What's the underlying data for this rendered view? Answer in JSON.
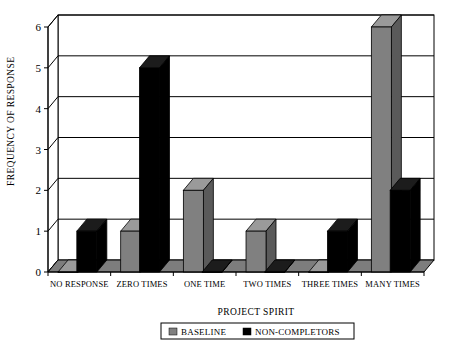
{
  "chart_data": {
    "type": "bar",
    "title": "",
    "xlabel": "PROJECT SPIRIT",
    "ylabel": "FREQUENCY OF RESPONSE",
    "categories": [
      "NO RESPONSE",
      "ZERO TIMES",
      "ONE TIME",
      "TWO TIMES",
      "THREE TIMES",
      "MANY TIMES"
    ],
    "series": [
      {
        "name": "BASELINE",
        "color": "#808080",
        "values": [
          0,
          1,
          2,
          1,
          0,
          6
        ]
      },
      {
        "name": "NON-COMPLETORS",
        "color": "#000000",
        "values": [
          1,
          5,
          0,
          0,
          1,
          2
        ]
      }
    ],
    "ylim": [
      0,
      6
    ],
    "yticks": [
      0,
      1,
      2,
      3,
      4,
      5,
      6
    ],
    "ytick_labels": [
      "0",
      "1",
      "2",
      "3",
      "4",
      "5",
      "6"
    ],
    "grid": true,
    "grid_axis": "y",
    "legend_position": "bottom",
    "style": "3d-column"
  },
  "axes": {
    "y_title": "FREQUENCY OF RESPONSE",
    "x_title": "PROJECT SPIRIT"
  },
  "legend": {
    "entries": [
      {
        "label": "BASELINE",
        "swatch": "#808080"
      },
      {
        "label": "NON-COMPLETORS",
        "swatch": "#000000"
      }
    ]
  },
  "colors": {
    "baseline_front": "#808080",
    "baseline_top": "#9a9a9a",
    "baseline_side": "#5a5a5a",
    "noncompletors_front": "#000000",
    "noncompletors_top": "#1c1c1c",
    "noncompletors_side": "#000000",
    "floor": "#7d7d7d",
    "floor_front": "#5e5e5e",
    "wall": "#ffffff",
    "frame": "#000000",
    "grid": "#000000"
  }
}
